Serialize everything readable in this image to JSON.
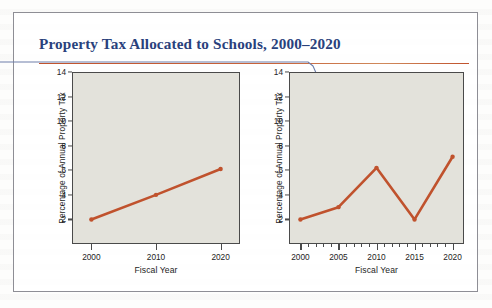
{
  "figure": {
    "title": "Property Tax Allocated to Schools, 2000–2020",
    "accent_rule_color": "#c0522d",
    "title_color": "#29417c",
    "leader_line_color": "#6e7faa",
    "border_color": "#8e8e95"
  },
  "chart_data": [
    {
      "type": "line",
      "name": "left-chart",
      "title": "",
      "xlabel": "Fiscal Year",
      "ylabel": "Percentage of Annual Property Tax",
      "categories": [
        "2000",
        "2010",
        "2020"
      ],
      "x": [
        2000,
        2010,
        2020
      ],
      "values": [
        2.0,
        4.0,
        6.1
      ],
      "xlim": [
        1997,
        2023
      ],
      "ylim": [
        0,
        14
      ],
      "yticks": [
        2,
        4,
        6,
        8,
        10,
        12,
        14
      ],
      "xticks": [
        2000,
        2010,
        2020
      ],
      "xminorticks": [],
      "grid": false,
      "legend": "none",
      "series_color": "#c0522d",
      "plot_background": "#e3e2db"
    },
    {
      "type": "line",
      "name": "right-chart",
      "title": "",
      "xlabel": "Fiscal Year",
      "ylabel": "Percentage of Annual Property Tax",
      "categories": [
        "2000",
        "2005",
        "2010",
        "2015",
        "2020"
      ],
      "x": [
        2000,
        2005,
        2010,
        2015,
        2020
      ],
      "values": [
        2.0,
        3.0,
        6.2,
        2.0,
        7.1
      ],
      "xlim": [
        1998.5,
        2021.5
      ],
      "ylim": [
        0,
        14
      ],
      "yticks": [
        2,
        4,
        6,
        8,
        10,
        12,
        14
      ],
      "xticks": [
        2000,
        2005,
        2010,
        2015,
        2020
      ],
      "xminorticks": [
        2001,
        2002,
        2003,
        2004,
        2006,
        2007,
        2008,
        2009,
        2011,
        2012,
        2013,
        2014,
        2016,
        2017,
        2018,
        2019
      ],
      "grid": false,
      "legend": "none",
      "series_color": "#c0522d",
      "plot_background": "#e3e2db"
    }
  ]
}
